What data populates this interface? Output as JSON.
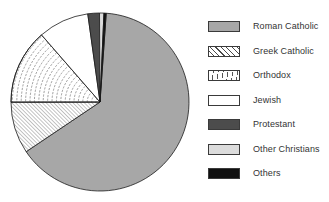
{
  "chart_data": {
    "type": "pie",
    "title": "",
    "legend_position": "right",
    "rotation_deg": 4,
    "outline_color": "#1a1a1a",
    "background_color": "#ffffff",
    "slices": [
      {
        "label": "Roman Catholic",
        "value": 64.4,
        "fill": "#a7a7a7",
        "pattern": "solid"
      },
      {
        "label": "Greek Catholic",
        "value": 9.4,
        "fill": "#ffffff",
        "pattern": "diagonal-hatch"
      },
      {
        "label": "Orthodox",
        "value": 13.6,
        "fill": "#ffffff",
        "pattern": "concentric-arcs"
      },
      {
        "label": "Jewish",
        "value": 9.2,
        "fill": "#ffffff",
        "pattern": "none"
      },
      {
        "label": "Protestant",
        "value": 2.1,
        "fill": "#4c4c4c",
        "pattern": "solid"
      },
      {
        "label": "Other Christians",
        "value": 0.8,
        "fill": "#dcdcdc",
        "pattern": "solid"
      },
      {
        "label": "Others",
        "value": 0.4,
        "fill": "#101010",
        "pattern": "solid"
      }
    ]
  }
}
